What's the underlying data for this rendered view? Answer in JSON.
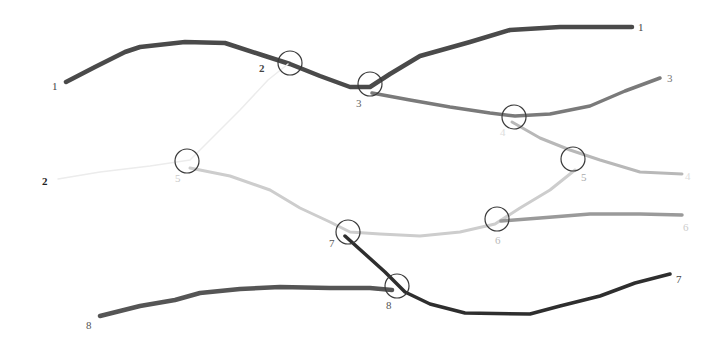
{
  "diagram": {
    "type": "branching-line-diagram",
    "lines": [
      {
        "id": "line-1",
        "color": "#4a4a4a",
        "width": 4.5,
        "points": "66,82 95,67 125,52 140,47 185,42 225,43 262,55 290,64 320,76 350,87 370,87 390,74 420,56 470,42 510,30 560,27 632,27"
      },
      {
        "id": "line-2",
        "color": "#ececec",
        "width": 1.5,
        "points": "58,179 100,172 150,166 190,160 210,140 240,110 268,80 288,64"
      },
      {
        "id": "line-3",
        "color": "#7a7a7a",
        "width": 3.5,
        "points": "372,93 410,100 450,107 490,113 515,116 550,114 590,106 625,91 660,78"
      },
      {
        "id": "line-4",
        "color": "#b8b8b8",
        "width": 3,
        "points": "512,122 540,138 570,150 600,160 640,172 682,174"
      },
      {
        "id": "line-5",
        "color": "#cdcdcd",
        "width": 3,
        "points": "190,168 230,176 270,190 300,208 330,222 350,232 380,234 420,236 460,232 495,224 520,208 550,190 575,170"
      },
      {
        "id": "line-6",
        "color": "#9a9a9a",
        "width": 3.5,
        "points": "501,221 540,218 590,214 640,214 682,215"
      },
      {
        "id": "line-7",
        "color": "#2e2e2e",
        "width": 3.5,
        "points": "345,236 365,254 385,272 405,292 430,304 465,313 530,314 560,306 600,296 635,283 670,274"
      },
      {
        "id": "line-8",
        "color": "#555555",
        "width": 4.5,
        "points": "100,316 140,306 175,300 200,293 240,289 280,287 330,288 370,288 392,290"
      }
    ],
    "junctions": [
      {
        "id": "junction-2",
        "cx": 290,
        "cy": 63,
        "r": 12
      },
      {
        "id": "junction-3",
        "cx": 370,
        "cy": 84,
        "r": 12
      },
      {
        "id": "junction-4",
        "cx": 514,
        "cy": 117,
        "r": 12
      },
      {
        "id": "junction-5-left",
        "cx": 187,
        "cy": 161,
        "r": 12
      },
      {
        "id": "junction-5-right",
        "cx": 573,
        "cy": 159,
        "r": 12
      },
      {
        "id": "junction-6",
        "cx": 497,
        "cy": 219,
        "r": 12
      },
      {
        "id": "junction-7",
        "cx": 348,
        "cy": 232,
        "r": 12
      },
      {
        "id": "junction-8",
        "cx": 397,
        "cy": 286,
        "r": 12
      }
    ],
    "labels": [
      {
        "id": "label-1-left",
        "text": "1",
        "x": 52,
        "y": 90,
        "color": "#444444",
        "weight": "normal"
      },
      {
        "id": "label-1-right",
        "text": "1",
        "x": 638,
        "y": 31,
        "color": "#444444",
        "weight": "normal"
      },
      {
        "id": "label-2-top",
        "text": "2",
        "x": 259,
        "y": 72,
        "color": "#444444",
        "weight": "bold"
      },
      {
        "id": "label-2-left",
        "text": "2",
        "x": 42,
        "y": 185,
        "color": "#222222",
        "weight": "bold"
      },
      {
        "id": "label-3-junction",
        "text": "3",
        "x": 356,
        "y": 107,
        "color": "#666666",
        "weight": "normal"
      },
      {
        "id": "label-3-right",
        "text": "3",
        "x": 667,
        "y": 82,
        "color": "#777777",
        "weight": "normal"
      },
      {
        "id": "label-4-junction",
        "text": "4",
        "x": 500,
        "y": 136,
        "color": "#dddddd",
        "weight": "normal"
      },
      {
        "id": "label-4-right",
        "text": "4",
        "x": 685,
        "y": 180,
        "color": "#dddddd",
        "weight": "normal"
      },
      {
        "id": "label-5-left",
        "text": "5",
        "x": 175,
        "y": 182,
        "color": "#c8c8c8",
        "weight": "normal"
      },
      {
        "id": "label-5-right",
        "text": "5",
        "x": 581,
        "y": 181,
        "color": "#aaaaaa",
        "weight": "normal"
      },
      {
        "id": "label-6-junction",
        "text": "6",
        "x": 495,
        "y": 244,
        "color": "#bbbbbb",
        "weight": "normal"
      },
      {
        "id": "label-6-right",
        "text": "6",
        "x": 683,
        "y": 231,
        "color": "#cccccc",
        "weight": "normal"
      },
      {
        "id": "label-7-junction",
        "text": "7",
        "x": 329,
        "y": 247,
        "color": "#555555",
        "weight": "normal"
      },
      {
        "id": "label-7-right",
        "text": "7",
        "x": 676,
        "y": 283,
        "color": "#444444",
        "weight": "normal"
      },
      {
        "id": "label-8-left",
        "text": "8",
        "x": 86,
        "y": 329,
        "color": "#555555",
        "weight": "normal"
      },
      {
        "id": "label-8-junction",
        "text": "8",
        "x": 386,
        "y": 309,
        "color": "#555555",
        "weight": "normal"
      }
    ],
    "junction_style": {
      "stroke": "#3a3a3a",
      "stroke_width": 1.2,
      "fill": "none"
    }
  }
}
